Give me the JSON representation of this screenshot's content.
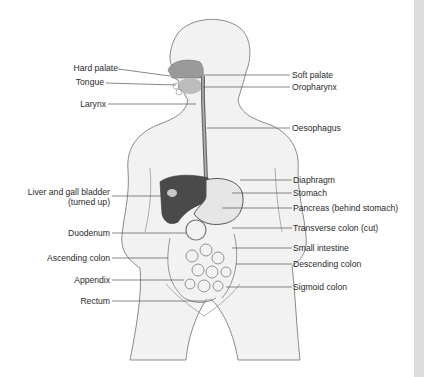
{
  "diagram": {
    "colors": {
      "body_fill": "#f2f2f2",
      "outline": "#8a8a8a",
      "liver": "#4a4a4a",
      "stomach": "#e6e6e6",
      "palate": "#9a9a9a",
      "oesophagus": "#7a7a7a",
      "leader_line": "#555555",
      "edge_strip": "#dcdcdc"
    },
    "labels_left": [
      {
        "id": "hard-palate",
        "text": "Hard palate"
      },
      {
        "id": "tongue",
        "text": "Tongue"
      },
      {
        "id": "larynx",
        "text": "Larynx"
      },
      {
        "id": "liver",
        "text": "Liver and gall bladder",
        "text2": "(turned up)"
      },
      {
        "id": "duodenum",
        "text": "Duodenum"
      },
      {
        "id": "ascending-colon",
        "text": "Ascending colon"
      },
      {
        "id": "appendix",
        "text": "Appendix"
      },
      {
        "id": "rectum",
        "text": "Rectum"
      }
    ],
    "labels_right": [
      {
        "id": "soft-palate",
        "text": "Soft palate"
      },
      {
        "id": "oropharynx",
        "text": "Oropharynx"
      },
      {
        "id": "oesophagus",
        "text": "Oesophagus"
      },
      {
        "id": "diaphragm",
        "text": "Diaphragm"
      },
      {
        "id": "stomach",
        "text": "Stomach"
      },
      {
        "id": "pancreas",
        "text": "Pancreas (behind stomach)"
      },
      {
        "id": "transverse-colon",
        "text": "Transverse colon (cut)"
      },
      {
        "id": "small-intestine",
        "text": "Small intestine"
      },
      {
        "id": "descending-colon",
        "text": "Descending colon"
      },
      {
        "id": "sigmoid-colon",
        "text": "Sigmoid colon"
      }
    ]
  }
}
